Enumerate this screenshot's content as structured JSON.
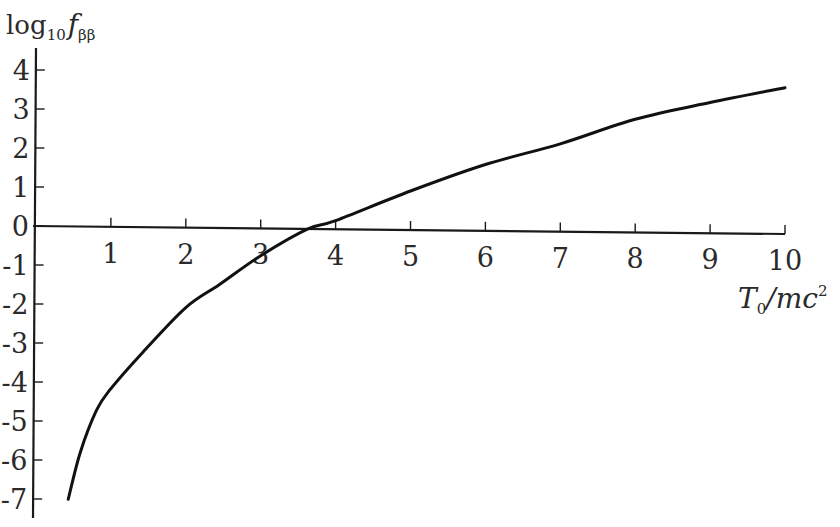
{
  "chart_data": {
    "type": "line",
    "title": "",
    "xlabel": "T0/mc^2",
    "ylabel": "log10 f_ββ",
    "xlim": [
      0,
      10
    ],
    "ylim": [
      -7,
      4
    ],
    "grid": false,
    "legend": null,
    "x_ticks": [
      "1",
      "2",
      "3",
      "4",
      "5",
      "6",
      "7",
      "8",
      "9",
      "10"
    ],
    "y_ticks": [
      "4",
      "3",
      "2",
      "1",
      "0",
      "-1",
      "-2",
      "-3",
      "-4",
      "-5",
      "-6",
      "-7"
    ],
    "series": [
      {
        "name": "log10 f_ββ",
        "x": [
          0.43,
          0.59,
          0.81,
          1.0,
          1.43,
          2.0,
          2.45,
          3.0,
          3.63,
          4.0,
          5.0,
          6.0,
          7.0,
          8.0,
          9.0,
          10.0
        ],
        "y": [
          -7.0,
          -5.8,
          -4.7,
          -4.15,
          -3.2,
          -2.05,
          -1.45,
          -0.7,
          0.0,
          0.22,
          1.0,
          1.7,
          2.25,
          2.9,
          3.35,
          3.75
        ]
      }
    ]
  },
  "labels": {
    "y_title_main": "log",
    "y_title_sub": "10",
    "y_title_f": "f",
    "y_title_f_sub": "ββ",
    "x_title_T": "T",
    "x_title_T_sub": "0",
    "x_title_rest": "/mc",
    "x_title_sup": "2"
  }
}
